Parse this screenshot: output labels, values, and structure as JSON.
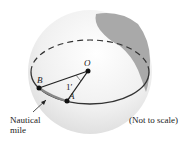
{
  "diagram": {
    "points": {
      "O": "O",
      "A": "A",
      "B": "B"
    },
    "angle_label": "1′",
    "arrow_label_line1": "Nautical",
    "arrow_label_line2": "mile",
    "note": "(Not to scale)"
  }
}
